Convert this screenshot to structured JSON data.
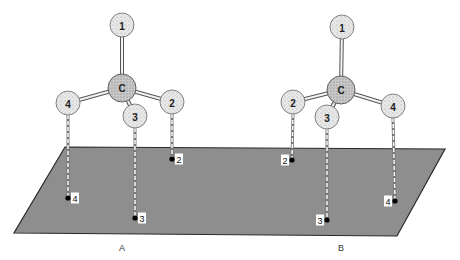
{
  "colors": {
    "plane_fill": "#8e8e8e",
    "plane_stroke": "#2a2a2a",
    "atom_fill": "#e4e4e4",
    "carbon_fill": "#bdbdbd",
    "bond": "#555555",
    "dashed": "#ffffff"
  },
  "plane": {
    "points": "65,147 445,149 397,236 14,233"
  },
  "molecules": [
    {
      "id": "A",
      "label": "A",
      "label_pos": [
        122,
        251
      ],
      "carbon": {
        "label": "C",
        "x": 122,
        "y": 88
      },
      "atoms": [
        {
          "label": "1",
          "x": 122,
          "y": 25,
          "proj": null
        },
        {
          "label": "2",
          "x": 172,
          "y": 102,
          "proj": {
            "x": 172,
            "y": 159,
            "label_dx": 7
          }
        },
        {
          "label": "3",
          "x": 135,
          "y": 116,
          "proj": {
            "x": 135,
            "y": 218,
            "label_dx": 7
          }
        },
        {
          "label": "4",
          "x": 68,
          "y": 103,
          "proj": {
            "x": 68,
            "y": 198,
            "label_dx": 7
          }
        }
      ]
    },
    {
      "id": "B",
      "label": "B",
      "label_pos": [
        341,
        251
      ],
      "carbon": {
        "label": "C",
        "x": 341,
        "y": 90
      },
      "atoms": [
        {
          "label": "1",
          "x": 342,
          "y": 27,
          "proj": null
        },
        {
          "label": "2",
          "x": 293,
          "y": 102,
          "proj": {
            "x": 292,
            "y": 160,
            "label_dx": -7
          }
        },
        {
          "label": "3",
          "x": 327,
          "y": 117,
          "proj": {
            "x": 327,
            "y": 220,
            "label_dx": -7
          }
        },
        {
          "label": "4",
          "x": 393,
          "y": 106,
          "proj": {
            "x": 395,
            "y": 201,
            "label_dx": -7
          }
        }
      ]
    }
  ]
}
